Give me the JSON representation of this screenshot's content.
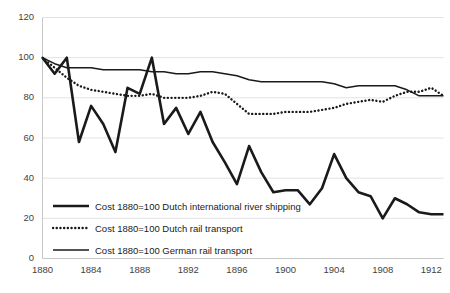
{
  "chart_data": {
    "type": "line",
    "title": "",
    "xlabel": "",
    "ylabel": "",
    "xlim": [
      1880,
      1913
    ],
    "ylim": [
      0,
      120
    ],
    "grid": true,
    "grid_axis": "y",
    "legend_position": "inside-bottom-left",
    "yticks": [
      0,
      20,
      40,
      60,
      80,
      100,
      120
    ],
    "xticks": [
      1880,
      1884,
      1888,
      1892,
      1896,
      1900,
      1904,
      1908,
      1912
    ],
    "x": [
      1880,
      1881,
      1882,
      1883,
      1884,
      1885,
      1886,
      1887,
      1888,
      1889,
      1890,
      1891,
      1892,
      1893,
      1894,
      1895,
      1896,
      1897,
      1898,
      1899,
      1900,
      1901,
      1902,
      1903,
      1904,
      1905,
      1906,
      1907,
      1908,
      1909,
      1910,
      1911,
      1912,
      1913
    ],
    "series": [
      {
        "name": "Cost 1880=100 Dutch international river shipping",
        "style": "thick-solid",
        "color": "#1a1a1a",
        "values": [
          100,
          92,
          100,
          58,
          76,
          67,
          53,
          85,
          82,
          100,
          67,
          75,
          62,
          73,
          58,
          48,
          37,
          56,
          43,
          33,
          34,
          34,
          27,
          35,
          52,
          40,
          33,
          31,
          20,
          30,
          27,
          23,
          22,
          22
        ]
      },
      {
        "name": "Cost 1880=100 Dutch rail transport",
        "style": "dotted",
        "color": "#1a1a1a",
        "values": [
          100,
          95,
          90,
          86,
          84,
          83,
          82,
          81,
          81,
          82,
          80,
          80,
          80,
          81,
          83,
          82,
          77,
          72,
          72,
          72,
          73,
          73,
          73,
          74,
          75,
          77,
          78,
          79,
          78,
          81,
          83,
          83,
          85,
          81
        ]
      },
      {
        "name": "Cost 1880=100 German rail transport",
        "style": "thin-solid",
        "color": "#1a1a1a",
        "values": [
          100,
          97,
          95,
          95,
          95,
          94,
          94,
          94,
          94,
          93,
          93,
          92,
          92,
          93,
          93,
          92,
          91,
          89,
          88,
          88,
          88,
          88,
          88,
          88,
          87,
          85,
          86,
          86,
          86,
          86,
          84,
          81,
          81,
          81
        ]
      }
    ]
  },
  "legend": {
    "items": [
      {
        "label": "Cost 1880=100 Dutch international river shipping",
        "style": "thick-solid"
      },
      {
        "label": "Cost 1880=100 Dutch rail transport",
        "style": "dotted"
      },
      {
        "label": "Cost 1880=100 German rail transport",
        "style": "thin-solid"
      }
    ]
  },
  "axis_labels": {
    "y": [
      "120",
      "100",
      "80",
      "60",
      "40",
      "20",
      "0"
    ],
    "x": [
      "1880",
      "1884",
      "1888",
      "1892",
      "1896",
      "1900",
      "1904",
      "1908",
      "1912"
    ]
  },
  "colors": {
    "line": "#1a1a1a",
    "grid": "#e2e2e2",
    "axis": "#c8c8c8",
    "tick_text": "#3f3f3f",
    "background": "#ffffff"
  }
}
